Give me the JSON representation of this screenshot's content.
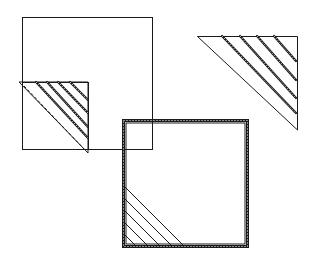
{
  "figure": {
    "stroke_color": "#1a1a1a",
    "background_color": "#ffffff",
    "panels": [
      {
        "id": "large-square-with-folded-corner",
        "pleat_count": 4
      },
      {
        "id": "pleated-triangle",
        "pleat_count": 4
      },
      {
        "id": "bordered-square",
        "corner_line_count": 5
      }
    ]
  }
}
